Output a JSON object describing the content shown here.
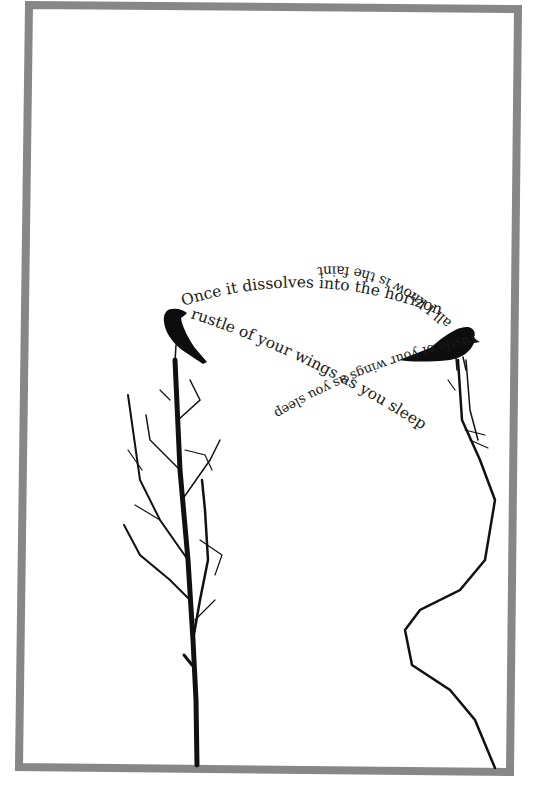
{
  "poem": {
    "lines": [
      {
        "id": "line1",
        "text": "Once it dissolves into the horizon",
        "orientation": "upright-arc"
      },
      {
        "id": "line2",
        "text": "all I know is the faint",
        "orientation": "upside-down-arc"
      },
      {
        "id": "line3",
        "text": "rustle of your wings as you sleep",
        "orientation": "diagonal-descending"
      },
      {
        "id": "line4",
        "text": "rustle of your wings as you sleep",
        "orientation": "diagonal-upside-down"
      }
    ]
  },
  "illustration": {
    "left_bird": "crow-silhouette-left",
    "right_bird": "crow-silhouette-right",
    "left_tree": "bare-sapling",
    "right_tree": "thorny-vine"
  },
  "colors": {
    "background": "#ffffff",
    "frame": "#878787",
    "ink": "#111111"
  }
}
